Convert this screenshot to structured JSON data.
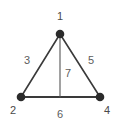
{
  "figure": {
    "type": "undirected-graph-diagram",
    "background_color": "#ffffff",
    "node_color": "#2b2b2b",
    "edge_color": "#3a3a3a",
    "label_color": "#585858"
  },
  "nodes": [
    {
      "id": "1",
      "label": "1",
      "x": 60,
      "y": 34,
      "label_x": 60,
      "label_y": 16
    },
    {
      "id": "2",
      "label": "2",
      "x": 21,
      "y": 97,
      "label_x": 13,
      "label_y": 111
    },
    {
      "id": "4",
      "label": "4",
      "x": 100,
      "y": 97,
      "label_x": 107,
      "label_y": 111
    }
  ],
  "edges": [
    {
      "id": "3",
      "label": "3",
      "from": "2",
      "to": "1",
      "label_x": 27,
      "label_y": 60
    },
    {
      "id": "5",
      "label": "5",
      "from": "1",
      "to": "4",
      "label_x": 91,
      "label_y": 60
    },
    {
      "id": "7",
      "label": "7",
      "from": "1",
      "to": "midpoint",
      "label_x": 68,
      "label_y": 73
    },
    {
      "id": "6",
      "label": "6",
      "from": "2",
      "to": "4",
      "label_x": 60,
      "label_y": 114
    }
  ],
  "median_line": {
    "x": 60,
    "y1": 34,
    "y2": 97
  }
}
